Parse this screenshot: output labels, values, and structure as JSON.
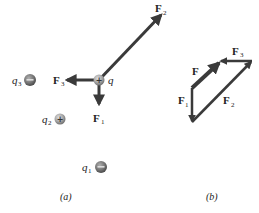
{
  "figure_a": {
    "caption": "(a)",
    "charges": [
      {
        "id": "q",
        "label": "q",
        "sub": "",
        "sign": "+",
        "cx": 99,
        "cy": 80
      },
      {
        "id": "q1",
        "label": "q",
        "sub": "1",
        "sign": "−",
        "cx": 100,
        "cy": 167
      },
      {
        "id": "q2",
        "label": "q",
        "sub": "2",
        "sign": "+",
        "cx": 60,
        "cy": 119
      },
      {
        "id": "q3",
        "label": "q",
        "sub": "3",
        "sign": "−",
        "cx": 30,
        "cy": 80
      }
    ],
    "forces": [
      {
        "id": "F1",
        "label": "F",
        "sub": "1",
        "from": [
          99,
          80
        ],
        "to": [
          99,
          104
        ]
      },
      {
        "id": "F2",
        "label": "F",
        "sub": "2",
        "from": [
          99,
          80
        ],
        "to": [
          161,
          15
        ]
      },
      {
        "id": "F3",
        "label": "F",
        "sub": "3",
        "from": [
          99,
          80
        ],
        "to": [
          66,
          80
        ]
      }
    ]
  },
  "figure_b": {
    "caption": "(b)",
    "vectors": [
      {
        "id": "F1",
        "label": "F",
        "sub": "1",
        "from": [
          192,
          88
        ],
        "to": [
          192,
          122
        ]
      },
      {
        "id": "F2",
        "label": "F",
        "sub": "2",
        "from": [
          192,
          122
        ],
        "to": [
          252,
          61
        ]
      },
      {
        "id": "F3",
        "label": "F",
        "sub": "3",
        "from": [
          252,
          61
        ],
        "to": [
          220,
          61
        ]
      },
      {
        "id": "F",
        "label": "F",
        "sub": "",
        "from": [
          192,
          88
        ],
        "to": [
          221,
          61
        ]
      }
    ]
  },
  "colors": {
    "arrow": "#3a3a3a",
    "charge_fill": "#8a8a8a",
    "charge_center": "#c8c8c8",
    "text": "#222222"
  }
}
